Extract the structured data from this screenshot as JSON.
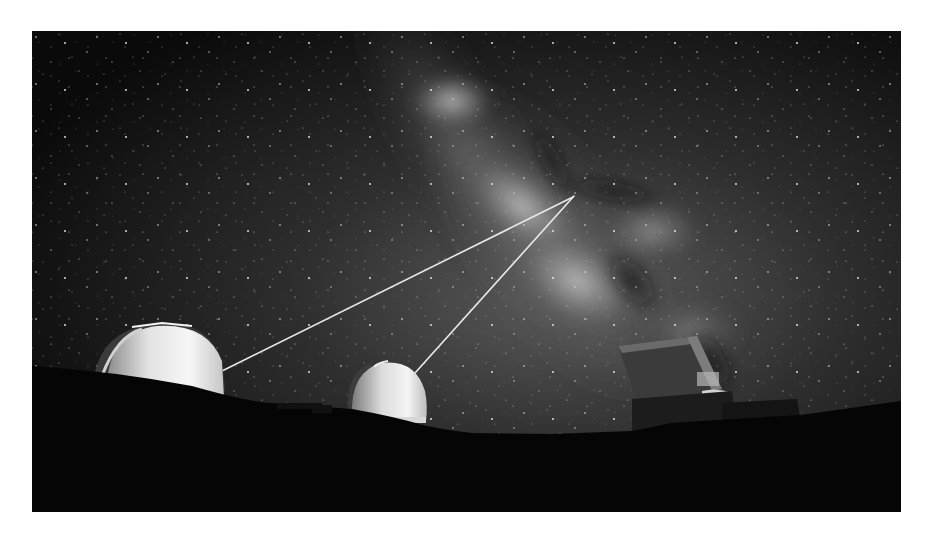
{
  "image": {
    "subject": "Observatory domes on a mountain summit firing twin laser guide stars into the Milky Way",
    "style": "black-and-white night photograph",
    "frame": {
      "x": 32,
      "y": 31,
      "width": 869,
      "height": 481
    },
    "colors": {
      "page_background": "#ffffff",
      "sky_dark": "#0c0c0c",
      "sky_glow": "#5a5a5a",
      "milky_way_core": "#b8b8b8",
      "ground": "#050505",
      "dome_light": "#f2f2f2",
      "dome_shade": "#9a9a9a",
      "laser": "#e6e6e6"
    },
    "elements": {
      "left_dome": "Large white observatory dome, left, emitting a laser beam",
      "middle_dome": "Smaller white observatory dome, center, emitting a laser beam",
      "right_building": "Boxy dark telescope enclosure on the right",
      "laser_beams": "Two thin laser beams converging on a point in the Milky Way",
      "milky_way": "Bright diagonal band of the Milky Way crossing the upper sky",
      "ground": "Dark silhouetted mountain ridge across the bottom"
    }
  }
}
